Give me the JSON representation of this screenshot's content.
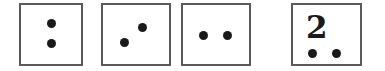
{
  "figure": {
    "type": "dot-pattern-cards",
    "background_color": "#ffffff",
    "card_border_color": "#58595b",
    "dot_color": "#1a1a1a",
    "card_count": 4,
    "cards": [
      {
        "id": "card-1",
        "name": "vertical-pair",
        "x": 19,
        "y": 3,
        "width": 64,
        "height": 63,
        "dot_count": 2,
        "numeral": "",
        "dots": [
          {
            "cx": 51,
            "cy": 23,
            "d": 9
          },
          {
            "cx": 51,
            "cy": 43,
            "d": 9
          }
        ]
      },
      {
        "id": "card-2",
        "name": "diagonal-pair",
        "x": 101,
        "y": 3,
        "width": 70,
        "height": 63,
        "dot_count": 2,
        "numeral": "",
        "dots": [
          {
            "cx": 142,
            "cy": 27,
            "d": 9
          },
          {
            "cx": 124,
            "cy": 42,
            "d": 9
          }
        ]
      },
      {
        "id": "card-3",
        "name": "horizontal-pair",
        "x": 181,
        "y": 3,
        "width": 70,
        "height": 63,
        "dot_count": 2,
        "numeral": "",
        "dots": [
          {
            "cx": 203,
            "cy": 35,
            "d": 9
          },
          {
            "cx": 227,
            "cy": 35,
            "d": 9
          }
        ]
      },
      {
        "id": "card-4",
        "name": "numeral-two-with-pair",
        "x": 291,
        "y": 3,
        "width": 71,
        "height": 63,
        "dot_count": 2,
        "numeral": "2",
        "numeral_x": 306,
        "numeral_y": 12,
        "numeral_size": 31,
        "dots": [
          {
            "cx": 312,
            "cy": 53,
            "d": 9
          },
          {
            "cx": 336,
            "cy": 53,
            "d": 9
          }
        ]
      }
    ]
  }
}
